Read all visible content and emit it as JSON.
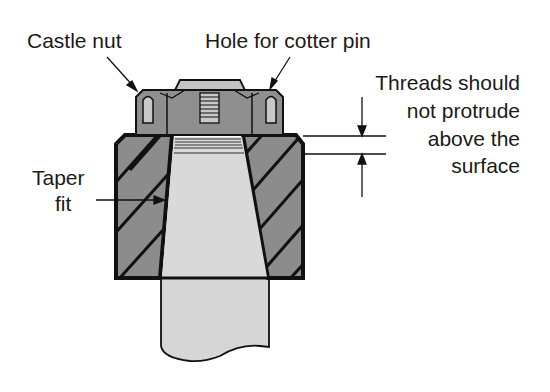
{
  "diagram": {
    "labels": {
      "castle_nut": "Castle nut",
      "hole_for_cotter_pin": "Hole for cotter pin",
      "threads_line1": "Threads should",
      "threads_line2": "not protrude",
      "threads_line3": "above the",
      "threads_line4": "surface",
      "taper_line1": "Taper",
      "taper_line2": "fit"
    },
    "colors": {
      "outline": "#111111",
      "hub_fill": "#8c8c8c",
      "nut_fill": "#8f8f8f",
      "shaft_fill": "#d6d6d6",
      "bolt_cap_fill": "#c4c4c4",
      "background": "#ffffff"
    }
  }
}
